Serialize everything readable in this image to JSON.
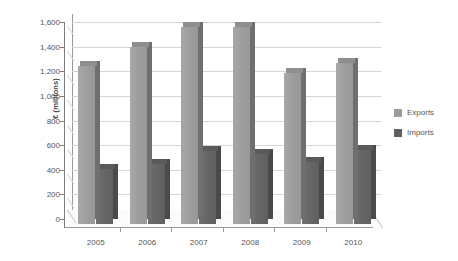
{
  "chart_data": {
    "type": "bar",
    "title": "",
    "xlabel": "",
    "ylabel": "€ (millions)",
    "categories": [
      "2005",
      "2006",
      "2007",
      "2008",
      "2009",
      "2010"
    ],
    "series": [
      {
        "name": "Exports",
        "color": "#9d9d9d",
        "values": [
          1280,
          1440,
          1600,
          1600,
          1230,
          1310
        ]
      },
      {
        "name": "Imports",
        "color": "#5f5f5f",
        "values": [
          450,
          490,
          590,
          570,
          500,
          600
        ]
      }
    ],
    "ylim": [
      0,
      1600
    ],
    "ytick_step": 200,
    "ytick_labels": [
      "1,600",
      "1,400",
      "1,200",
      "1,000",
      "800",
      "600",
      "400",
      "200",
      "0"
    ],
    "ytick_values": [
      1600,
      1400,
      1200,
      1000,
      800,
      600,
      400,
      200,
      0
    ],
    "grid": true,
    "legend_position": "right",
    "style": "3d-column"
  },
  "legend": {
    "items": [
      {
        "label": "Exports"
      },
      {
        "label": "Imports"
      }
    ]
  }
}
